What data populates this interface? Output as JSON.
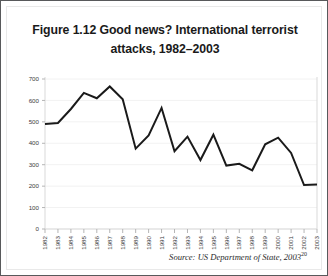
{
  "figure": {
    "title": "Figure 1.12 Good news? International terrorist attacks, 1982–2003",
    "title_line1": "Figure 1.12 Good news? International terrorist",
    "title_line2": "attacks, 1982–2003",
    "source_text": "Source: US Department of State, 2003",
    "source_superscript": "20",
    "border_color": "#58595b",
    "line_color": "#1a1a1a",
    "gridline_color": "#f2f2f2",
    "axis_color": "#d9d9d9"
  },
  "chart_data": {
    "type": "line",
    "title": "Figure 1.12 Good news? International terrorist attacks, 1982–2003",
    "xlabel": "",
    "ylabel": "",
    "ylim": [
      0,
      700
    ],
    "yticks": [
      0,
      100,
      200,
      300,
      400,
      500,
      600,
      700
    ],
    "ytick_labels": [
      "0",
      "100",
      "200",
      "300",
      "400",
      "500",
      "600",
      "700"
    ],
    "grid": true,
    "legend": false,
    "categories": [
      "1982",
      "1983",
      "1984",
      "1985",
      "1986",
      "1987",
      "1988",
      "1989",
      "1990",
      "1991",
      "1992",
      "1993",
      "1994",
      "1995",
      "1996",
      "1997",
      "1998",
      "1999",
      "2000",
      "2001",
      "2002",
      "2003"
    ],
    "values": [
      490,
      495,
      560,
      635,
      610,
      665,
      605,
      375,
      437,
      565,
      363,
      431,
      322,
      440,
      296,
      304,
      274,
      395,
      426,
      355,
      205,
      208
    ],
    "series": [
      {
        "name": "International terrorist attacks",
        "values": [
          490,
          495,
          560,
          635,
          610,
          665,
          605,
          375,
          437,
          565,
          363,
          431,
          322,
          440,
          296,
          304,
          274,
          395,
          426,
          355,
          205,
          208
        ]
      }
    ]
  }
}
